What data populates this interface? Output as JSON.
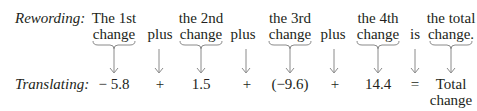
{
  "rewording": {
    "label": "Rewording:",
    "terms": [
      {
        "line1": "The 1st",
        "line2": "change"
      },
      {
        "op": "plus"
      },
      {
        "line1": "the 2nd",
        "line2": "change"
      },
      {
        "op": "plus"
      },
      {
        "line1": "the 3rd",
        "line2": "change"
      },
      {
        "op": "plus"
      },
      {
        "line1": "the 4th",
        "line2": "change"
      },
      {
        "op": "is"
      },
      {
        "line1": "the total",
        "line2": "change."
      }
    ]
  },
  "translating": {
    "label": "Translating:",
    "terms": [
      "− 5.8",
      "+",
      "1.5",
      "+",
      "(−9.6)",
      "+",
      "14.4",
      "=",
      "Total",
      "change"
    ]
  },
  "colors": {
    "text": "#231f20",
    "arrow": "#8a8a8a"
  }
}
